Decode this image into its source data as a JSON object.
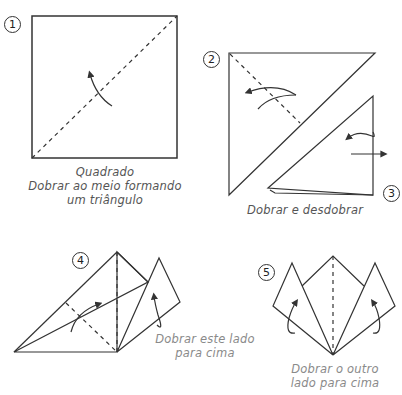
{
  "steps": [
    {
      "number": "1",
      "caption": [
        "Quadrado",
        "Dobrar ao meio formando",
        "um triângulo"
      ]
    },
    {
      "number": "2",
      "caption": []
    },
    {
      "number": "3",
      "caption": [
        "Dobrar e desdobrar"
      ]
    },
    {
      "number": "4",
      "caption": [
        "Dobrar este lado",
        "para cima"
      ]
    },
    {
      "number": "5",
      "caption": [
        "Dobrar o outro",
        "lado para cima"
      ]
    }
  ],
  "colors": {
    "line": "#333333",
    "text": "#555555",
    "light_text": "#8a8a8a",
    "background": "#ffffff"
  }
}
